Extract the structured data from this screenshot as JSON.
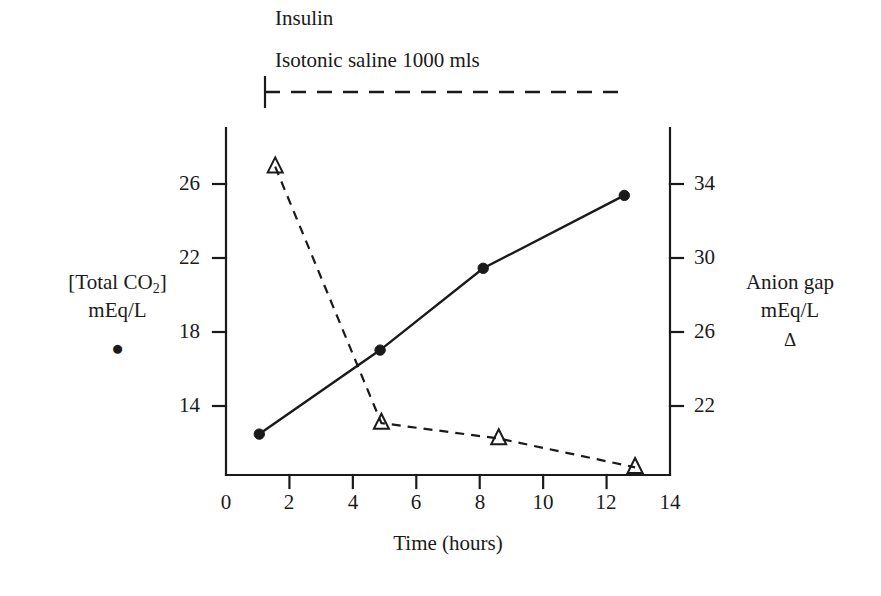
{
  "figure": {
    "annotations": {
      "insulin": "Insulin",
      "saline": "Isotonic saline  1000 mls"
    },
    "left_axis": {
      "title_line1": "[Total CO",
      "title_sub": "2",
      "title_line1_close": "]",
      "title_line2": "mEq/L",
      "marker_glyph": "●",
      "ticks": [
        "26",
        "22",
        "18",
        "14"
      ]
    },
    "right_axis": {
      "title_line1": "Anion gap",
      "title_line2": "mEq/L",
      "marker_glyph": "Δ",
      "ticks": [
        "34",
        "30",
        "26",
        "22"
      ]
    },
    "x_axis": {
      "title": "Time (hours)",
      "ticks": [
        "0",
        "2",
        "4",
        "6",
        "8",
        "10",
        "12",
        "14"
      ]
    },
    "colors": {
      "ink": "#1a1a1a",
      "background": "#ffffff"
    }
  },
  "chart_data": {
    "type": "line",
    "title": "",
    "xlabel": "Time (hours)",
    "xlim": [
      0,
      14
    ],
    "xticks": [
      0,
      2,
      4,
      6,
      8,
      10,
      12,
      14
    ],
    "grid": false,
    "legend": "inline axis titles with marker glyphs",
    "annotations": [
      {
        "text": "Insulin",
        "x": 1.5,
        "y_note": "above timeline bar"
      },
      {
        "text": "Isotonic saline  1000 mls",
        "x": 1.5,
        "y_note": "above timeline bar"
      },
      {
        "text": "dashed infusion timeline bar",
        "x_start": 1.5,
        "x_end": 12.6
      }
    ],
    "series": [
      {
        "name": "[Total CO2] mEq/L",
        "marker": "filled-circle",
        "linestyle": "solid",
        "axis": "left",
        "ylabel": "[Total CO2] mEq/L",
        "ylim": [
          12.15,
          27.85
        ],
        "yticks": [
          14,
          18,
          22,
          26
        ],
        "x": [
          1.05,
          4.86,
          8.11,
          12.56
        ],
        "y": [
          14.0,
          17.8,
          21.5,
          24.8
        ]
      },
      {
        "name": "Anion gap mEq/L",
        "marker": "open-triangle",
        "linestyle": "dashed",
        "axis": "right",
        "ylabel": "Anion gap mEq/L",
        "ylim": [
          20.15,
          35.85
        ],
        "yticks": [
          22,
          26,
          30,
          34
        ],
        "x": [
          1.55,
          4.9,
          8.6,
          12.9
        ],
        "y": [
          34.1,
          22.5,
          21.8,
          20.5
        ]
      }
    ]
  }
}
